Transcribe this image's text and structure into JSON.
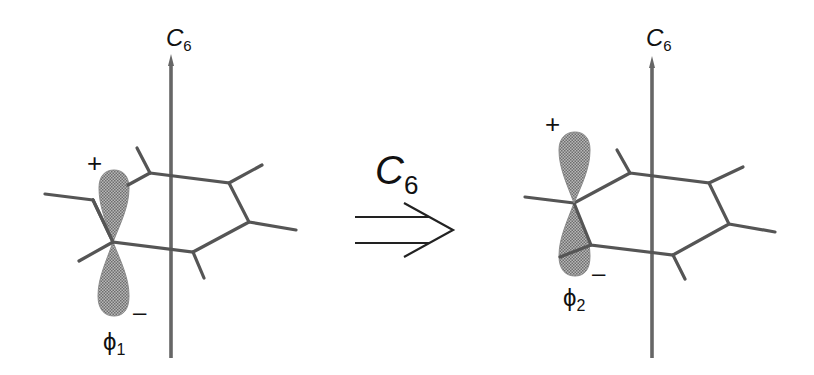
{
  "figure": {
    "colors": {
      "bond": "#555555",
      "axis": "#666666",
      "lobe": "#8c8c8c",
      "text": "#111111",
      "background": "#ffffff"
    },
    "left_molecule": {
      "axis_label": {
        "main": "C",
        "sub": "6"
      },
      "orbital_label": {
        "main": "ϕ",
        "sub": "1"
      },
      "positive_sign": "+",
      "negative_sign": "–"
    },
    "operation": {
      "label": {
        "main": "C",
        "sub": "6"
      },
      "arrow": "double-line-arrow"
    },
    "right_molecule": {
      "axis_label": {
        "main": "C",
        "sub": "6"
      },
      "orbital_label": {
        "main": "ϕ",
        "sub": "2"
      },
      "positive_sign": "+",
      "negative_sign": "–"
    }
  }
}
